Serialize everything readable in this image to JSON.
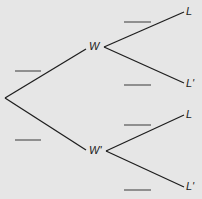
{
  "diagram": {
    "type": "tree",
    "background": "#e6e6e6",
    "line_color": "#1e1e1e",
    "blank_color": "#555555",
    "nodes": {
      "first_level": [
        {
          "label": "W"
        },
        {
          "label": "W'"
        }
      ],
      "second_level": [
        {
          "label": "L"
        },
        {
          "label": "L'"
        },
        {
          "label": "L"
        },
        {
          "label": "L'"
        }
      ]
    },
    "blanks_count": 6
  }
}
